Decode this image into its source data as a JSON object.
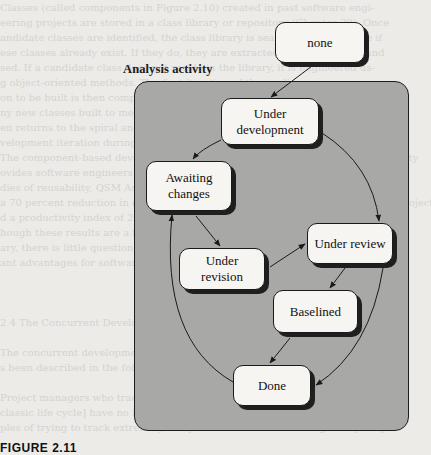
{
  "figure": {
    "caption": "FIGURE 2.11",
    "region_label": "Analysis activity"
  },
  "states": {
    "none": "none",
    "under_development": "Under development",
    "awaiting_changes": "Awaiting changes",
    "under_revision": "Under revision",
    "under_review": "Under review",
    "baselined": "Baselined",
    "done": "Done"
  },
  "state_lines": {
    "under_development": [
      "Under",
      "development"
    ],
    "awaiting_changes": [
      "Awaiting",
      "changes"
    ],
    "under_revision": [
      "Under",
      "revision"
    ]
  },
  "transitions": [
    {
      "from": "none",
      "to": "under_development"
    },
    {
      "from": "under_development",
      "to": "awaiting_changes"
    },
    {
      "from": "under_development",
      "to": "under_review"
    },
    {
      "from": "awaiting_changes",
      "to": "under_revision"
    },
    {
      "from": "under_revision",
      "to": "under_review"
    },
    {
      "from": "under_review",
      "to": "baselined"
    },
    {
      "from": "baselined",
      "to": "done"
    },
    {
      "from": "under_review",
      "to": "done"
    },
    {
      "from": "done",
      "to": "awaiting_changes"
    }
  ],
  "bleed_through_text": [
    "Classes (called components in Figure 2.10) created in past software engi-",
    "eering projects are stored in a class library or repository (Chapter 29). Once",
    "andidate classes are identified, the class library is searched to determine if",
    "ese classes already exist. If they do, they are extracted from the library and",
    "sed. If a candidate class does not reside in the library, it is engineered us-",
    "g object-oriented methods. The first iteration of the appli-",
    "on to be built is then composed, using classes extracted from the library and",
    "ny new classes built to meet the unique needs of the application. Process flow",
    "en returns to the spiral and will ultimately re-enter the component assembly",
    "velopment iteration during subsequent passes through the engineering activity.",
    "The component-based development model leads to software reuse, and reusability",
    "ovides software engineers with a number of measurable benefits. Based on",
    "dies of reusability, QSM Associates, Inc., reports component assembly leads",
    "a 70 percent reduction in development cycle time; an 84 percent reduction in project cost,",
    "d a productivity index of 26.2, compared to an industry norm of 16.9 [YOU94].",
    "hough these results are a function of the robustness of the component li-",
    "ary, there is little question that the component assembly model provides signi-",
    "ant advantages for software engineers.",
    "",
    "",
    "",
    "2.4 The Concurrent Development Model",
    "",
    "The concurrent development model, sometimes called concurrent engineering,",
    "s been described in the following manner by Davis and Sitaram [DAV94]:",
    "",
    "Project managers who track project status in terms of the major phases [of the",
    "classic life cycle] have no idea of the status of their projects. These are exam-",
    "ples of trying to track extremely complex sets of activities using overly simple"
  ]
}
